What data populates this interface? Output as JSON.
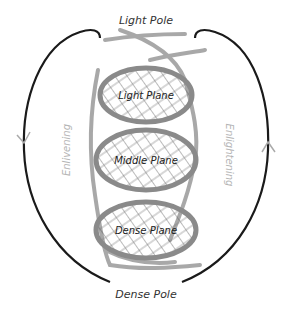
{
  "diagram": {
    "poles": {
      "top": "Light Pole",
      "bottom": "Dense Pole"
    },
    "planes": [
      {
        "label": "Light Plane"
      },
      {
        "label": "Middle Plane"
      },
      {
        "label": "Dense Plane"
      }
    ],
    "side_labels": {
      "left": "Enlivening",
      "right": "Enlightening"
    },
    "colors": {
      "outer_arc": "#1a1a1a",
      "spiral": "#9a9a9a",
      "side_text": "#b5b5b5",
      "label_text": "#333333",
      "hatch": "#555555"
    }
  }
}
